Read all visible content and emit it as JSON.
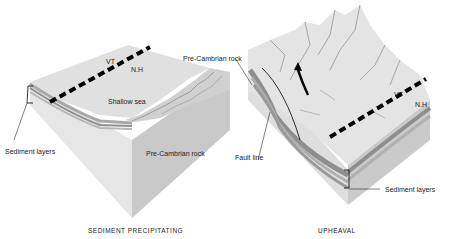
{
  "left_panel": {
    "caption": "SEDIMENT PRECIPITATING",
    "labels": {
      "vt": "VT",
      "nh": "N.H",
      "shallow_sea": "Shallow sea",
      "sediment_layers": "Sediment layers",
      "pre_cambrian_rock": "Pre-Cambrian rock"
    }
  },
  "right_panel": {
    "caption": "UPHEAVAL",
    "labels": {
      "pre_cambrian_rock": "Pre-Cambrian rock",
      "vt": "VT",
      "nh": "N.H",
      "fault_line": "Fault line",
      "sediment_layers": "Sediment layers"
    }
  },
  "colors": {
    "top_surface": "#e2e2e2",
    "side_light": "#dcdcdc",
    "side_dark": "#c4c4c4",
    "sediment_dark": "#8e8e8e",
    "sediment_mid": "#b0b0b0",
    "border_line": "#000000"
  }
}
